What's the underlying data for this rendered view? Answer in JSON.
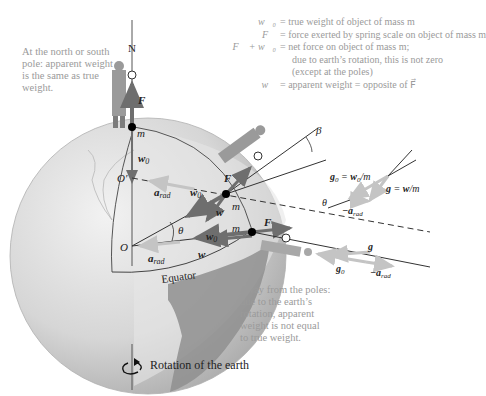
{
  "legend": {
    "rows": [
      {
        "symbol": "w0",
        "symbol_display": "w⃗₀",
        "text": "= true weight of object of mass m"
      },
      {
        "symbol": "F",
        "symbol_display": "F⃗",
        "text": "= force exerted by spring scale on object of mass m"
      },
      {
        "symbol": "F+w0",
        "symbol_display": "F⃗ + w⃗₀",
        "text": "= net force on object of mass m;"
      },
      {
        "symbol": "",
        "symbol_display": "",
        "text": "due to earth’s rotation, this is not zero"
      },
      {
        "symbol": "",
        "symbol_display": "",
        "text": "(except at the poles)"
      },
      {
        "symbol": "w",
        "symbol_display": "w⃗",
        "text": "= apparent weight = opposite of F⃗"
      }
    ]
  },
  "notes": {
    "pole": [
      "At the north or south",
      "pole: apparent weight",
      "is the same as true",
      "weight."
    ],
    "equator": [
      "Away from the poles:",
      "due to the earth’s",
      "rotation, apparent",
      "weight is not equal",
      "to true weight."
    ],
    "rotation": "Rotation of the earth"
  },
  "labels": {
    "north": "N",
    "mass": "m",
    "force": "F",
    "true_weight": "w0",
    "apparent_weight": "w",
    "radial_accel": "a_rad",
    "neg_radial_accel": "-a_rad",
    "center": "O",
    "center_prime": "O′",
    "theta": "θ",
    "beta": "β",
    "equator": "Equator",
    "g0_eq": "g0 = w0/m",
    "g_eq": "g = w/m",
    "g": "g",
    "g0": "g0"
  },
  "colors": {
    "globe_light": "#e8e8e8",
    "globe_mid": "#cfcfcf",
    "globe_dark": "#9c9c9c",
    "land": "#8f8f8f",
    "vector_dark": "#6e6e6e",
    "vector_light": "#c8c8c8",
    "text_gray": "#9a9a9a",
    "line": "#333333"
  }
}
